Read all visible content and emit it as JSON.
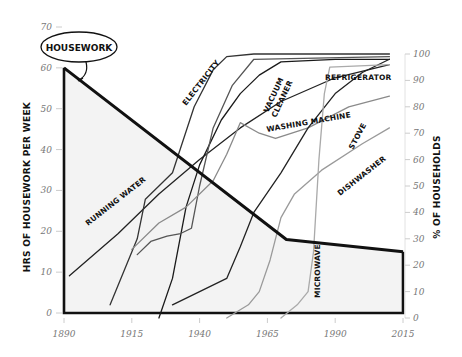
{
  "chart_data": {
    "type": "line",
    "title": "",
    "xlabel": "",
    "ylabel_left": "HRS OF HOUSEWORK PER WEEK",
    "ylabel_right": "% OF HOUSEHOLDS",
    "x_ticks": [
      1890,
      1915,
      1940,
      1965,
      1990,
      2015
    ],
    "y_left_ticks": [
      0,
      10,
      20,
      30,
      40,
      50,
      60,
      70
    ],
    "y_right_ticks": [
      0,
      10,
      20,
      30,
      40,
      50,
      60,
      70,
      80,
      90,
      100
    ],
    "xlim": [
      1890,
      2015
    ],
    "ylim_left": [
      0,
      70
    ],
    "ylim_right": [
      0,
      100
    ],
    "grid": false,
    "housework": {
      "name": "HOUSEWORK",
      "axis": "left",
      "points": [
        [
          1890,
          60
        ],
        [
          1972,
          18
        ],
        [
          2015,
          15
        ]
      ]
    },
    "series": [
      {
        "name": "RUNNING WATER",
        "axis": "right",
        "color": "#222222",
        "points": [
          [
            1892,
            16
          ],
          [
            1910,
            32
          ],
          [
            1925,
            47
          ],
          [
            1940,
            60
          ],
          [
            1955,
            72
          ],
          [
            1970,
            82
          ],
          [
            1990,
            91
          ],
          [
            2010,
            96
          ]
        ]
      },
      {
        "name": "ELECTRICITY",
        "axis": "right",
        "color": "#333333",
        "points": [
          [
            1907,
            5
          ],
          [
            1917,
            30
          ],
          [
            1920,
            45
          ],
          [
            1925,
            50
          ],
          [
            1930,
            55
          ],
          [
            1938,
            80
          ],
          [
            1945,
            94
          ],
          [
            1950,
            99
          ],
          [
            1960,
            100
          ],
          [
            2010,
            100
          ]
        ]
      },
      {
        "name": "REFRIGERATOR",
        "axis": "right",
        "color": "#1a1a1a",
        "points": [
          [
            1925,
            0
          ],
          [
            1930,
            15
          ],
          [
            1935,
            42
          ],
          [
            1940,
            58
          ],
          [
            1948,
            75
          ],
          [
            1955,
            85
          ],
          [
            1962,
            92
          ],
          [
            1970,
            97
          ],
          [
            1990,
            98
          ],
          [
            2010,
            98
          ]
        ]
      },
      {
        "name": "VACUUM CLEANER",
        "axis": "right",
        "color": "#555555",
        "points": [
          [
            1917,
            24
          ],
          [
            1922,
            29
          ],
          [
            1928,
            31
          ],
          [
            1933,
            32
          ],
          [
            1937,
            34
          ],
          [
            1940,
            50
          ],
          [
            1945,
            72
          ],
          [
            1952,
            88
          ],
          [
            1960,
            98
          ],
          [
            2010,
            99
          ]
        ]
      },
      {
        "name": "WASHING MACHINE",
        "axis": "right",
        "color": "#8a8a8a",
        "points": [
          [
            1915,
            26
          ],
          [
            1925,
            36
          ],
          [
            1935,
            42
          ],
          [
            1945,
            52
          ],
          [
            1950,
            62
          ],
          [
            1955,
            74
          ],
          [
            1962,
            70
          ],
          [
            1968,
            68
          ],
          [
            1980,
            72
          ],
          [
            1995,
            80
          ],
          [
            2010,
            84
          ]
        ]
      },
      {
        "name": "STOVE",
        "axis": "right",
        "color": "#222222",
        "points": [
          [
            1930,
            5
          ],
          [
            1940,
            10
          ],
          [
            1950,
            15
          ],
          [
            1955,
            27
          ],
          [
            1960,
            40
          ],
          [
            1970,
            55
          ],
          [
            1980,
            72
          ],
          [
            1990,
            85
          ],
          [
            2000,
            93
          ],
          [
            2010,
            98
          ]
        ]
      },
      {
        "name": "DISHWASHER",
        "axis": "right",
        "color": "#9a9a9a",
        "points": [
          [
            1950,
            0
          ],
          [
            1958,
            5
          ],
          [
            1962,
            10
          ],
          [
            1966,
            22
          ],
          [
            1970,
            38
          ],
          [
            1975,
            47
          ],
          [
            1985,
            56
          ],
          [
            2000,
            66
          ],
          [
            2010,
            72
          ]
        ]
      },
      {
        "name": "MICROWAVE",
        "axis": "right",
        "color": "#aaaaaa",
        "points": [
          [
            1970,
            0
          ],
          [
            1976,
            5
          ],
          [
            1980,
            10
          ],
          [
            1982,
            25
          ],
          [
            1984,
            60
          ],
          [
            1986,
            85
          ],
          [
            1988,
            95
          ],
          [
            2010,
            96
          ]
        ]
      }
    ]
  },
  "labels": {
    "housework": "HOUSEWORK",
    "ylabel_left": "HRS OF HOUSEWORK PER WEEK",
    "ylabel_right": "% OF HOUSEHOLDS",
    "running_water": "RUNNING WATER",
    "electricity": "ELECTRICITY",
    "refrigerator": "REFRIGERATOR",
    "vacuum_cleaner_1": "VACUUM",
    "vacuum_cleaner_2": "CLEANER",
    "washing_machine": "WASHING MACHINE",
    "stove": "STOVE",
    "dishwasher": "DISHWASHER",
    "microwave": "MICROWAVE"
  }
}
